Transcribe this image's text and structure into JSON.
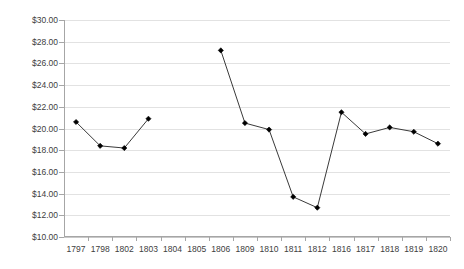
{
  "chart_data": {
    "type": "line",
    "title": "",
    "subtitle": "",
    "xlabel": "",
    "ylabel": "",
    "categories": [
      "1797",
      "1798",
      "1802",
      "1803",
      "1804",
      "1805",
      "1806",
      "1809",
      "1810",
      "1811",
      "1812",
      "1816",
      "1817",
      "1818",
      "1819",
      "1820"
    ],
    "values": [
      20.6,
      18.4,
      18.2,
      20.9,
      null,
      null,
      27.2,
      20.5,
      19.9,
      13.7,
      12.7,
      21.5,
      19.5,
      20.1,
      19.7,
      18.6
    ],
    "series": [
      {
        "name": "",
        "values": [
          20.6,
          18.4,
          18.2,
          20.9,
          null,
          null,
          27.2,
          20.5,
          19.9,
          13.7,
          12.7,
          21.5,
          19.5,
          20.1,
          19.7,
          18.6
        ]
      }
    ],
    "ylim": [
      10,
      30
    ],
    "ytick_step": 2,
    "ytick_labels": [
      "$30.00",
      "$28.00",
      "$26.00",
      "$24.00",
      "$22.00",
      "$20.00",
      "$18.00",
      "$16.00",
      "$14.00",
      "$12.00",
      "$10.00"
    ],
    "ytick_values": [
      30,
      28,
      26,
      24,
      22,
      20,
      18,
      16,
      14,
      12,
      10
    ],
    "grid": true,
    "grid_axis": "y",
    "legend": false,
    "legend_position": "none",
    "marker": "diamond",
    "marker_color": "#000000",
    "line_color": "#3a3a3a",
    "grid_color": "#e2e2e2",
    "axis_color": "#a6a6a6",
    "background": "#ffffff",
    "annotations": []
  }
}
